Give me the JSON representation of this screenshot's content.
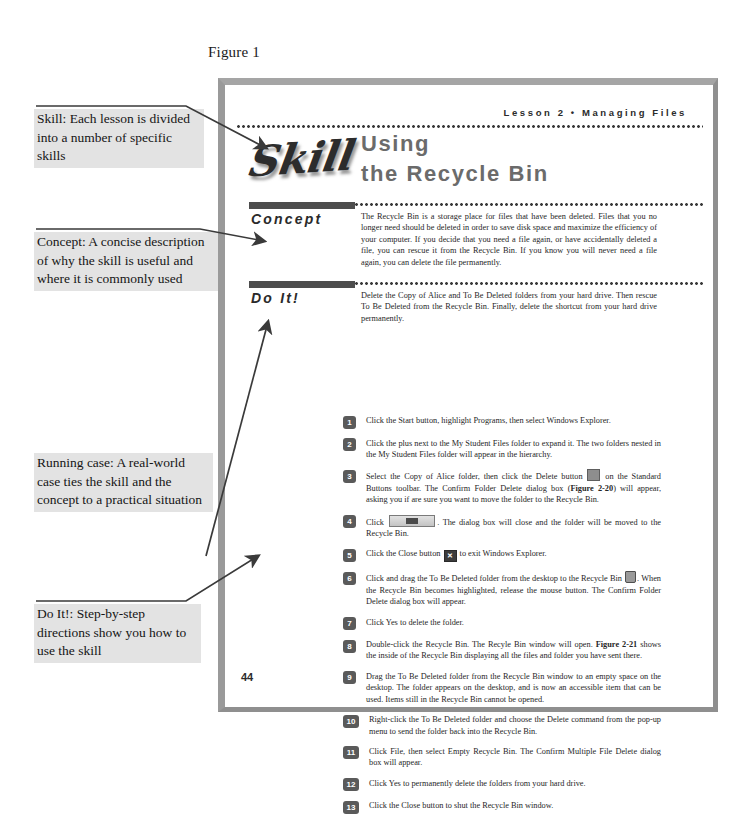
{
  "figure": {
    "label": "Figure 1"
  },
  "page": {
    "running_head": "Lesson 2 • Managing Files",
    "skill_logo": "Skill",
    "title_line1": "Using",
    "title_line2": "the Recycle Bin",
    "page_number": "44",
    "sections": {
      "concept_label": "Concept",
      "doit_label": "Do It!"
    },
    "concept_text": "The Recycle Bin is a storage place for files that have been deleted. Files that you no longer need should be deleted in order to save disk space and maximize the efficiency of your computer. If you decide that you need a file again, or have accidentally deleted a file, you can rescue it from the Recycle Bin. If you know you will never need a file again, you can delete the file permanently.",
    "doit_intro": "Delete the Copy of Alice and To Be Deleted folders from your hard drive. Then rescue To Be Deleted from the Recycle Bin. Finally, delete the shortcut from your hard drive permanently.",
    "steps": [
      {
        "num": "1",
        "text": "Click the Start button, highlight Programs, then select Windows Explorer."
      },
      {
        "num": "2",
        "text": "Click the plus next to the My Student Files folder to expand it. The two folders nested in the My Student Files folder will appear in the hierarchy."
      },
      {
        "num": "3",
        "text_a": "Select the Copy of Alice folder, then click the Delete button",
        "icon": "delete-button-icon",
        "text_b": "on the Standard Buttons toolbar. The Confirm Folder Delete dialog box (",
        "bold": "Figure 2-20",
        "text_c": ") will appear, asking you if are sure you want to move the folder to the Recycle Bin."
      },
      {
        "num": "4",
        "text_a": "Click",
        "icon": "ok-button-icon",
        "text_b": ". The dialog box will close and the folder will be moved to the Recycle Bin."
      },
      {
        "num": "5",
        "text_a": "Click the Close button",
        "icon": "close-button-icon",
        "text_b": "to exit Windows Explorer."
      },
      {
        "num": "6",
        "text_a": "Click and drag the To Be Deleted folder from the desktop to the Recycle Bin",
        "icon": "recycle-bin-icon",
        "text_b": ". When the Recycle Bin becomes highlighted, release the mouse button. The Confirm Folder Delete dialog box will appear."
      },
      {
        "num": "7",
        "text": "Click Yes to delete the folder."
      },
      {
        "num": "8",
        "text_a": "Double-click the Recycle Bin. The Recyle Bin window will open.",
        "bold": "Figure 2-21",
        "text_c": "shows the inside of the Recycle Bin displaying all the files and folder you have sent there."
      },
      {
        "num": "9",
        "text": "Drag the To Be Deleted folder from the Recycle Bin window to an empty space on the desktop. The folder appears on the desktop, and is now an accessible item that can be used. Items still in the Recycle Bin cannot be opened."
      },
      {
        "num": "10",
        "text": "Right-click the To Be Deleted folder and choose the Delete command from the pop-up menu to send the folder back into the Recycle Bin."
      },
      {
        "num": "11",
        "text": "Click File, then select Empty Recycle Bin. The Confirm Multiple File Delete dialog box will appear."
      },
      {
        "num": "12",
        "text": "Click Yes to permanently delete the folders from your hard drive."
      },
      {
        "num": "13",
        "text": "Click the Close button to shut the Recycle Bin window."
      }
    ]
  },
  "annotations": [
    {
      "id": "skill",
      "text": "Skill: Each lesson is divided into a number of specific skills"
    },
    {
      "id": "concept",
      "text": "Concept: A concise description of why the skill is useful and where it is commonly used"
    },
    {
      "id": "running-case",
      "text": "Running case: A real-world case ties the skill and the concept to a practical situation"
    },
    {
      "id": "doit",
      "text": "Do It!: Step-by-step directions show you how to use the skill"
    }
  ],
  "colors": {
    "frame": "#9a9a9a",
    "section_bar": "#4d4d4d",
    "title": "#6b6b6b",
    "annotation_bg": "#e3e3e3",
    "step_marker": "#5a5a5a"
  }
}
